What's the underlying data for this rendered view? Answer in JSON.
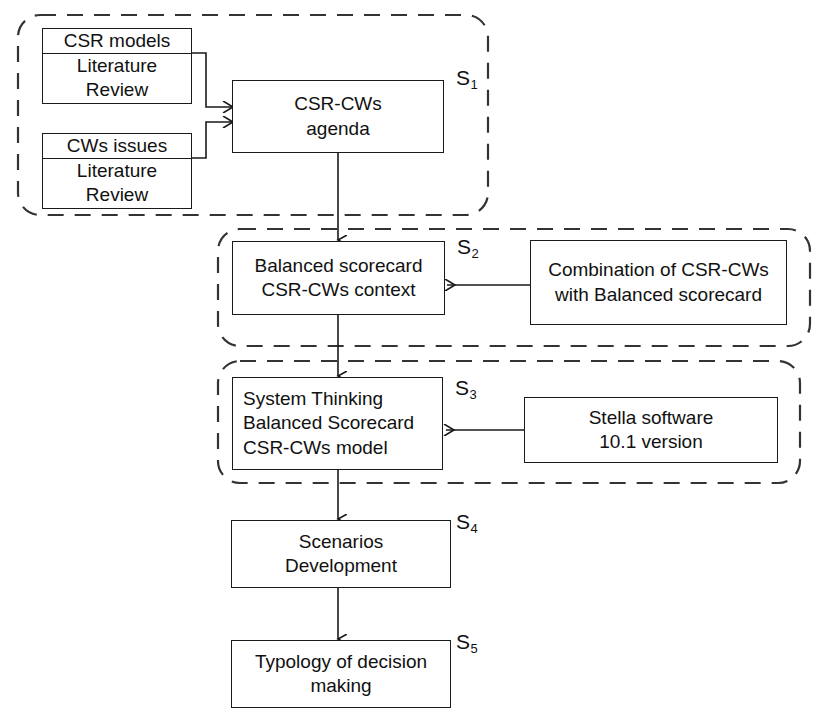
{
  "diagram": {
    "line_color": "#1a1a1a",
    "dash_color": "#333333",
    "background": "#ffffff"
  },
  "nodes": {
    "csr_models": {
      "head": "CSR models",
      "body": [
        "Literature",
        "Review"
      ]
    },
    "cws_issues": {
      "head": "CWs issues",
      "body": [
        "Literature",
        "Review"
      ]
    },
    "csr_cws_agenda": {
      "lines": [
        "CSR-CWs",
        "agenda"
      ]
    },
    "balanced_scorecard": {
      "lines": [
        "Balanced scorecard",
        "CSR-CWs context"
      ]
    },
    "combination": {
      "lines": [
        "Combination of CSR-CWs",
        "with Balanced scorecard"
      ]
    },
    "system_thinking": {
      "lines": [
        "System Thinking",
        "Balanced Scorecard",
        "CSR-CWs model"
      ]
    },
    "stella": {
      "lines": [
        "Stella software",
        "10.1 version"
      ]
    },
    "scenarios": {
      "lines": [
        "Scenarios",
        "Development"
      ]
    },
    "typology": {
      "lines": [
        "Typology of decision",
        "making"
      ]
    }
  },
  "stages": [
    {
      "id": "s1",
      "letter": "S",
      "index": "1"
    },
    {
      "id": "s2",
      "letter": "S",
      "index": "2"
    },
    {
      "id": "s3",
      "letter": "S",
      "index": "3"
    },
    {
      "id": "s4",
      "letter": "S",
      "index": "4"
    },
    {
      "id": "s5",
      "letter": "S",
      "index": "5"
    }
  ]
}
